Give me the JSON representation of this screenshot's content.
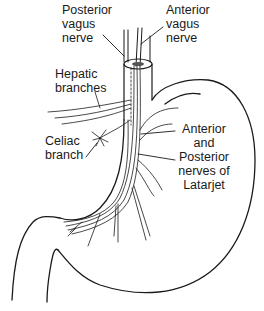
{
  "figure": {
    "line_color": "#1a1a1a",
    "background": "#ffffff"
  },
  "labels": {
    "posterior_vagus": [
      "Posterior",
      "vagus",
      "nerve"
    ],
    "anterior_vagus": [
      "Anterior",
      "vagus",
      "nerve"
    ],
    "hepatic": [
      "Hepatic",
      "branches"
    ],
    "celiac": [
      "Celiac",
      "branch"
    ],
    "latarjet": [
      "Anterior",
      "and",
      "Posterior",
      "nerves of",
      "Latarjet"
    ]
  }
}
